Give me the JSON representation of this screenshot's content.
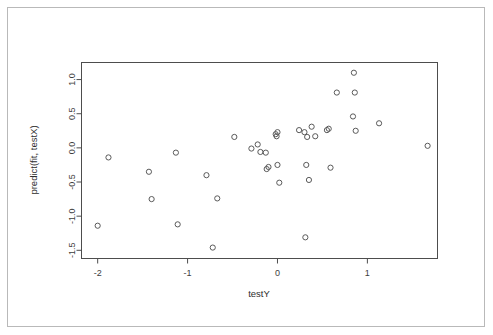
{
  "chart_data": {
    "type": "scatter",
    "title": "",
    "xlabel": "testY",
    "ylabel": "predict(fit, testX)",
    "xlim": [
      -2.18,
      1.78
    ],
    "ylim": [
      -1.62,
      1.25
    ],
    "xticks": [
      -2,
      -1,
      0,
      1
    ],
    "xtick_labels": [
      "-2",
      "-1",
      "0",
      "1"
    ],
    "yticks": [
      1.0,
      0.5,
      0.0,
      -0.5,
      -1.0,
      -1.5
    ],
    "ytick_labels": [
      "1.0",
      "0.5",
      "0.0",
      "-0.5",
      "-1.0",
      "-1.5"
    ],
    "grid": false,
    "legend": null,
    "marker": "open-circle",
    "marker_color": "#5a5a5a",
    "points": [
      {
        "x": -2.0,
        "y": -1.14
      },
      {
        "x": -1.88,
        "y": -0.14
      },
      {
        "x": -1.43,
        "y": -0.35
      },
      {
        "x": -1.4,
        "y": -0.75
      },
      {
        "x": -1.13,
        "y": -0.07
      },
      {
        "x": -1.11,
        "y": -1.12
      },
      {
        "x": -0.79,
        "y": -0.4
      },
      {
        "x": -0.72,
        "y": -1.46
      },
      {
        "x": -0.67,
        "y": -0.74
      },
      {
        "x": -0.48,
        "y": 0.16
      },
      {
        "x": -0.29,
        "y": -0.01
      },
      {
        "x": -0.22,
        "y": 0.05
      },
      {
        "x": -0.19,
        "y": -0.06
      },
      {
        "x": -0.13,
        "y": -0.07
      },
      {
        "x": -0.12,
        "y": -0.31
      },
      {
        "x": -0.1,
        "y": -0.28
      },
      {
        "x": -0.02,
        "y": 0.2
      },
      {
        "x": -0.01,
        "y": 0.17
      },
      {
        "x": 0.0,
        "y": 0.23
      },
      {
        "x": 0.0,
        "y": -0.25
      },
      {
        "x": 0.02,
        "y": -0.51
      },
      {
        "x": 0.24,
        "y": 0.26
      },
      {
        "x": 0.3,
        "y": 0.23
      },
      {
        "x": 0.31,
        "y": -1.31
      },
      {
        "x": 0.32,
        "y": -0.25
      },
      {
        "x": 0.33,
        "y": 0.16
      },
      {
        "x": 0.35,
        "y": -0.47
      },
      {
        "x": 0.38,
        "y": 0.31
      },
      {
        "x": 0.42,
        "y": 0.17
      },
      {
        "x": 0.55,
        "y": 0.26
      },
      {
        "x": 0.57,
        "y": 0.28
      },
      {
        "x": 0.59,
        "y": -0.29
      },
      {
        "x": 0.66,
        "y": 0.81
      },
      {
        "x": 0.84,
        "y": 0.46
      },
      {
        "x": 0.85,
        "y": 1.1
      },
      {
        "x": 0.86,
        "y": 0.81
      },
      {
        "x": 0.87,
        "y": 0.25
      },
      {
        "x": 1.13,
        "y": 0.36
      },
      {
        "x": 1.67,
        "y": 0.03
      }
    ]
  }
}
